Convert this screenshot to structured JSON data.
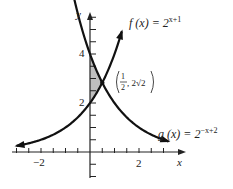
{
  "chart_data": {
    "type": "line",
    "title": "",
    "xlabel": "x",
    "ylabel": "y",
    "xlim": [
      -3,
      3.7
    ],
    "ylim": [
      -1,
      5.7
    ],
    "x_tick_step": 0.5,
    "y_tick_step": 0.5,
    "x_tick_labels": [
      {
        "value": -2,
        "label": "−2"
      },
      {
        "value": 2,
        "label": "2"
      }
    ],
    "y_tick_labels": [
      {
        "value": 2,
        "label": "2"
      },
      {
        "value": 4,
        "label": "4"
      }
    ],
    "grid": false,
    "series": [
      {
        "name": "f",
        "expression": "2^(x+1)",
        "label_prefix": "f (x) = 2",
        "label_exp": "x+1",
        "x_range": [
          -3,
          1.3
        ]
      },
      {
        "name": "g",
        "expression": "2^(-x+2)",
        "label_prefix": "g (x) = 2",
        "label_exp": "−x+2",
        "x_range": [
          -1.4,
          3.2
        ]
      }
    ],
    "intersection": {
      "x": 0.5,
      "y": 2.828,
      "label_num": "1",
      "label_den": "2",
      "label_y": "2√2"
    },
    "shaded_region": {
      "x_from": 0,
      "x_to": 0.5,
      "between": [
        "f",
        "g"
      ],
      "color": "#bfbfbf"
    }
  },
  "labels": {
    "x_axis": "x",
    "y_axis": "y",
    "tick_neg2": "−2",
    "tick_2x": "2",
    "tick_2y": "2",
    "tick_4y": "4",
    "f_prefix": "f (x) = 2",
    "f_exp": "x+1",
    "g_prefix": "g (x) = 2",
    "g_exp": "−x+2",
    "point_num": "1",
    "point_den": "2",
    "point_y": ", 2√2"
  }
}
